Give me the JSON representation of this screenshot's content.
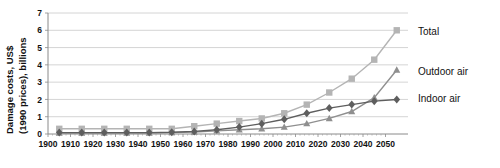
{
  "chart_data": {
    "type": "line",
    "title": "",
    "xlabel": "",
    "ylabel": "Damage costs, US$ (1990 prices), billions",
    "ylabel_line1": "Damage costs, US$",
    "ylabel_line2": "(1990 prices), billions",
    "x": [
      1905,
      1915,
      1925,
      1935,
      1945,
      1955,
      1965,
      1975,
      1985,
      1995,
      2005,
      2015,
      2025,
      2035,
      2045,
      2055
    ],
    "xtick_labels": [
      "1900",
      "1910",
      "1920",
      "1930",
      "1940",
      "1950",
      "1960",
      "1970",
      "1980",
      "1990",
      "2000",
      "2010",
      "2020",
      "2030",
      "2040",
      "2050"
    ],
    "ytick_labels": [
      "0",
      "1",
      "2",
      "3",
      "4",
      "5",
      "6",
      "7"
    ],
    "xlim": [
      1900,
      2060
    ],
    "ylim": [
      0,
      7
    ],
    "grid": true,
    "legend_position": "right",
    "series": [
      {
        "name": "Total",
        "color": "#b4b4b4",
        "marker": "square",
        "values": [
          0.3,
          0.3,
          0.3,
          0.3,
          0.3,
          0.3,
          0.45,
          0.6,
          0.75,
          0.9,
          1.2,
          1.7,
          2.4,
          3.2,
          4.3,
          6.0
        ]
      },
      {
        "name": "Outdoor air",
        "color": "#8f8f8f",
        "marker": "triangle",
        "values": [
          0.05,
          0.05,
          0.05,
          0.05,
          0.05,
          0.08,
          0.12,
          0.18,
          0.25,
          0.3,
          0.4,
          0.6,
          0.9,
          1.3,
          2.1,
          3.7
        ]
      },
      {
        "name": "Indoor air",
        "color": "#5e5e5e",
        "marker": "diamond",
        "values": [
          0.08,
          0.08,
          0.08,
          0.08,
          0.08,
          0.1,
          0.15,
          0.25,
          0.4,
          0.6,
          0.85,
          1.2,
          1.5,
          1.7,
          1.9,
          2.0
        ]
      }
    ],
    "legend_entries": [
      {
        "label": "Total",
        "color": "#b4b4b4"
      },
      {
        "label": "Outdoor air",
        "color": "#8f8f8f"
      },
      {
        "label": "Indoor air",
        "color": "#5e5e5e"
      }
    ]
  },
  "caption": {
    "text": ""
  }
}
